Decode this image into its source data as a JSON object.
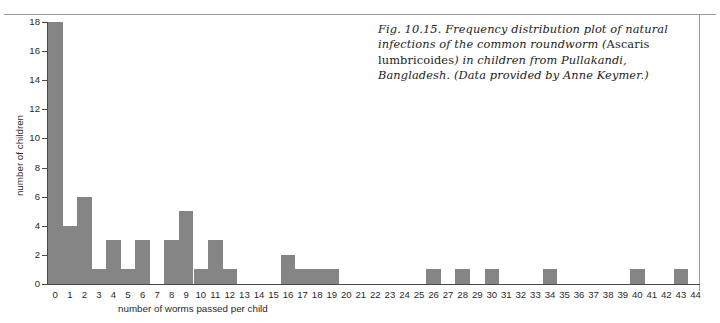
{
  "figure": {
    "caption_prefix": "Fig. 10.15. Frequency distribution plot of natural infections of the common roundworm (",
    "caption_species": "Ascaris lumbricoides",
    "caption_suffix": ") in children from Pullakandi, Bangladesh. (Data provided by Anne Keymer.)"
  },
  "chart_data": {
    "type": "bar",
    "title": "",
    "xlabel": "number of worms passed per child",
    "ylabel": "number of children",
    "xlim": [
      0,
      44
    ],
    "ylim": [
      0,
      18
    ],
    "ytick_values": [
      0,
      2,
      4,
      6,
      8,
      10,
      12,
      14,
      16,
      18
    ],
    "grid": false,
    "legend": null,
    "bar_color": "#858585",
    "categories": [
      0,
      1,
      2,
      3,
      4,
      5,
      6,
      7,
      8,
      9,
      10,
      11,
      12,
      13,
      14,
      15,
      16,
      17,
      18,
      19,
      20,
      21,
      22,
      23,
      24,
      25,
      26,
      27,
      28,
      29,
      30,
      31,
      32,
      33,
      34,
      35,
      36,
      37,
      38,
      39,
      40,
      41,
      42,
      43,
      44
    ],
    "values": [
      18,
      4,
      6,
      1,
      3,
      1,
      3,
      0,
      3,
      5,
      1,
      3,
      1,
      0,
      0,
      0,
      2,
      1,
      1,
      1,
      0,
      0,
      0,
      0,
      0,
      0,
      1,
      0,
      1,
      0,
      1,
      0,
      0,
      0,
      1,
      0,
      0,
      0,
      0,
      0,
      1,
      0,
      0,
      1,
      0
    ]
  }
}
